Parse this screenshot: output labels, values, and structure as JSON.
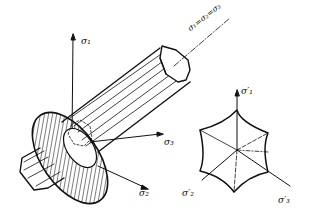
{
  "labels": {
    "sigma1": "σ₁",
    "sigma2": "σ₂",
    "sigma3": "σ₃",
    "hydrostatic_axis": "σ₁=σ₂=σ₃",
    "sigma1_prime": "σ′₁",
    "sigma2_prime": "σ′₂",
    "sigma3_prime": "σ′₃"
  },
  "colors": {
    "line": "#111111",
    "background": "#ffffff"
  }
}
